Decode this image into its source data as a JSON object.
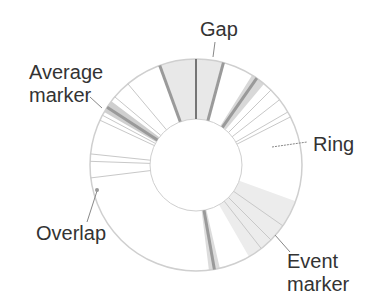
{
  "diagram": {
    "type": "annotated ring chart",
    "center": [
      196,
      165
    ],
    "outer_radius": 106,
    "inner_radius": 46,
    "colors": {
      "ring_outline": "#cfcfcf",
      "gap_fill": "#e8e8e8",
      "marker_dark": "#9a9a9a",
      "marker_light": "#c8c8c8",
      "event_fill": "#ececec",
      "label_text": "#333333",
      "leader": "#888888"
    },
    "labels": {
      "gap": "Gap",
      "average_marker_line1": "Average",
      "average_marker_line2": "marker",
      "ring": "Ring",
      "overlap": "Overlap",
      "event_marker_line1": "Event",
      "event_marker_line2": "marker"
    },
    "gap_sector": {
      "start_deg": -20,
      "end_deg": 15
    },
    "event_sector": {
      "start_deg": 110,
      "end_deg": 150
    },
    "thick_markers_deg": [
      -20,
      15,
      35,
      -57,
      170
    ],
    "thin_markers_deg": [
      0,
      -62,
      -50,
      -40,
      -65,
      45,
      52,
      60,
      63,
      -88,
      -84,
      -97,
      125,
      135,
      142
    ]
  }
}
